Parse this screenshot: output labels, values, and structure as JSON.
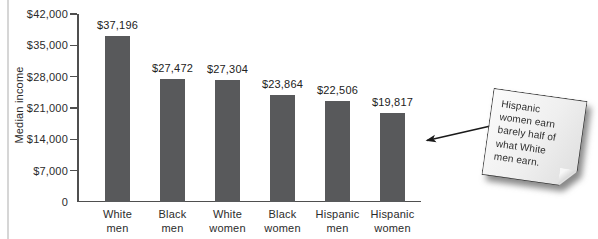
{
  "figure": {
    "ylabel": "Median income"
  },
  "chart_data": {
    "type": "bar",
    "title": "",
    "xlabel": "",
    "ylabel": "Median income",
    "categories": [
      "White\nmen",
      "Black\nmen",
      "White\nwomen",
      "Black\nwomen",
      "Hispanic\nmen",
      "Hispanic\nwomen"
    ],
    "values": [
      37196,
      27472,
      27304,
      23864,
      22506,
      19817
    ],
    "value_labels": [
      "$37,196",
      "$27,472",
      "$27,304",
      "$23,864",
      "$22,506",
      "$19,817"
    ],
    "ytick_values": [
      0,
      7000,
      14000,
      21000,
      28000,
      35000,
      42000
    ],
    "ytick_labels": [
      "0",
      "$7,000",
      "$14,000",
      "$21,000",
      "$28,000",
      "$35,000",
      "$42,000"
    ],
    "ylim": [
      0,
      42000
    ],
    "grid": false,
    "legend_position": "none",
    "bar_color": "#58595b",
    "axis_color": "#4f4f4f",
    "text_color": "#2b2b2b"
  },
  "annotation": {
    "note_text": "Hispanic\nwomen earn\nbarely half of\nwhat White\nmen earn.",
    "arrow_color": "#1a1a1a"
  }
}
